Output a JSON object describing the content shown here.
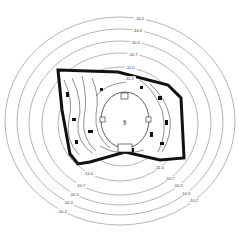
{
  "diagram": {
    "type": "contour-map",
    "line_color": "#6b6b6b",
    "plan_color": "#111111",
    "contours": [
      {
        "label": "-10.2",
        "rx": 115,
        "ry": 104,
        "cx": 120,
        "cy": 121
      },
      {
        "label": "-10.3",
        "rx": 103,
        "ry": 93,
        "cx": 120,
        "cy": 122
      },
      {
        "label": "-10.5",
        "rx": 91,
        "ry": 82,
        "cx": 120,
        "cy": 123
      },
      {
        "label": "-10.7",
        "rx": 78,
        "ry": 71,
        "cx": 120,
        "cy": 124
      },
      {
        "label": "-11.0",
        "rx": 62,
        "ry": 57,
        "cx": 120,
        "cy": 124
      },
      {
        "label": "-11.2",
        "rx": 45,
        "ry": 44,
        "cx": 122,
        "cy": 122
      }
    ],
    "labels": {
      "top": [
        "-10.2",
        "-10.3",
        "-10.5",
        "-10.7",
        "-11.0",
        "-11.2"
      ],
      "bottom_left": [
        "-10.2",
        "-10.3",
        "-10.5",
        "-10.7",
        "-11.0"
      ],
      "bottom_right": [
        "-10.5",
        "-10.3",
        "-10.2",
        "-10.7",
        "-11.0"
      ]
    },
    "center_mark": "§"
  }
}
